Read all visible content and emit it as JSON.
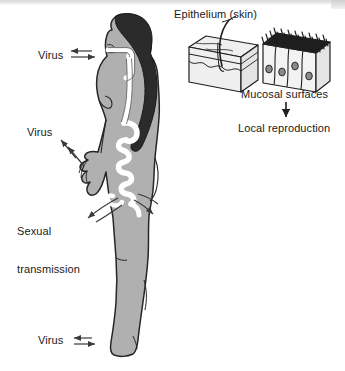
{
  "figure": {
    "background_color": "#ffffff",
    "width": 345,
    "height": 371
  },
  "colors": {
    "body_fill": "#b0b0b0",
    "body_outline": "#262626",
    "hair_fill": "#2b2b2b",
    "tract_fill": "#ffffff",
    "block_fill": "#efefef",
    "cilia_fill": "#1f1f1f",
    "nucleus_fill": "#8a8a8a",
    "text": "#1a1a1a",
    "arrow": "#3a3a3a",
    "scan_band": "#d8d8d8"
  },
  "labels": {
    "virus_nose": "Virus",
    "virus_arm": "Virus",
    "sexual_transmission_line1": "Sexual",
    "sexual_transmission_line2": "transmission",
    "virus_foot": "Virus",
    "epithelium": "Epithelium (skin)",
    "mucosal": "Mucosal surfaces",
    "local_reproduction": "Local reproduction"
  },
  "icons": {
    "body": "human-body-profile-icon",
    "hair": "hair-icon",
    "tract": "respiratory-digestive-tract-icon",
    "skin_block": "skin-epithelium-block-icon",
    "mucosa_block": "mucosal-epithelium-block-icon",
    "arrow_nose_in": "arrow-right-icon",
    "arrow_nose_out": "arrow-left-icon",
    "arrow_arm_1": "arrow-upleft-icon",
    "arrow_arm_2": "arrow-upleft-icon",
    "arrow_sexual_in": "curved-arrow-left-icon",
    "arrow_sexual_out": "curved-arrow-right-icon",
    "arrow_foot_in": "arrow-right-icon",
    "arrow_foot_out": "arrow-left-icon",
    "arrow_down": "arrow-down-icon",
    "leader_epithelium": "leader-line-icon"
  }
}
